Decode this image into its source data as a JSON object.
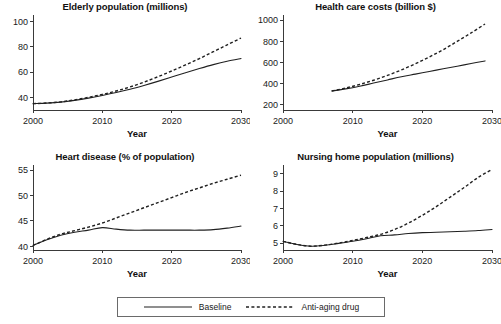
{
  "legend": {
    "name": "chart-legend",
    "entries": [
      {
        "label": "Baseline",
        "style": "solid"
      },
      {
        "label": "Anti-aging drug",
        "style": "dashed"
      }
    ]
  },
  "chart_data": [
    {
      "type": "line",
      "panel": "elderly-population",
      "title": "Elderly population (millions)",
      "xlabel": "Year",
      "ylabel": "",
      "xlim": [
        2000,
        2030
      ],
      "ylim": [
        30,
        105
      ],
      "xticks": [
        2000,
        2010,
        2020,
        2030
      ],
      "yticks": [
        40,
        60,
        80,
        100
      ],
      "grid": false,
      "legend_position": "bottom-outside",
      "x": [
        2000,
        2002,
        2004,
        2006,
        2008,
        2010,
        2012,
        2014,
        2016,
        2018,
        2020,
        2022,
        2024,
        2026,
        2028,
        2030
      ],
      "series": [
        {
          "name": "Baseline",
          "style": "solid",
          "values": [
            35,
            35.4,
            36.2,
            37.6,
            39.4,
            41.5,
            43.8,
            46.4,
            49.4,
            52.6,
            56.0,
            59.4,
            62.7,
            65.8,
            68.5,
            70.7
          ]
        },
        {
          "name": "Anti-aging drug",
          "style": "dashed",
          "values": [
            35,
            35.5,
            36.4,
            38.0,
            40.0,
            42.3,
            45.0,
            48.2,
            52.0,
            56.2,
            60.8,
            65.6,
            70.6,
            76.0,
            81.4,
            86.8
          ]
        }
      ]
    },
    {
      "type": "line",
      "panel": "health-care-costs",
      "title": "Health care costs (billion $)",
      "xlabel": "Year",
      "ylabel": "",
      "xlim": [
        2000,
        2030
      ],
      "ylim": [
        150,
        1050
      ],
      "xticks": [
        2000,
        2010,
        2020,
        2030
      ],
      "yticks": [
        200,
        400,
        600,
        800,
        1000
      ],
      "grid": false,
      "legend_position": "bottom-outside",
      "x": [
        2007,
        2009,
        2011,
        2013,
        2015,
        2017,
        2019,
        2021,
        2023,
        2025,
        2027,
        2029
      ],
      "series": [
        {
          "name": "Baseline",
          "style": "solid",
          "values": [
            330,
            350,
            375,
            405,
            435,
            465,
            490,
            515,
            540,
            565,
            590,
            615
          ]
        },
        {
          "name": "Anti-aging drug",
          "style": "dashed",
          "values": [
            330,
            358,
            392,
            432,
            478,
            530,
            588,
            652,
            722,
            800,
            880,
            965
          ]
        }
      ]
    },
    {
      "type": "line",
      "panel": "heart-disease",
      "title": "Heart disease (% of population)",
      "xlabel": "Year",
      "ylabel": "",
      "xlim": [
        2000,
        2030
      ],
      "ylim": [
        39.3,
        56
      ],
      "xticks": [
        2000,
        2010,
        2020,
        2030
      ],
      "yticks": [
        40,
        45,
        50,
        55
      ],
      "grid": false,
      "legend_position": "bottom-outside",
      "x": [
        2000,
        2002,
        2004,
        2006,
        2008,
        2010,
        2012,
        2014,
        2016,
        2018,
        2020,
        2022,
        2024,
        2026,
        2028,
        2030
      ],
      "series": [
        {
          "name": "Baseline",
          "style": "solid",
          "values": [
            40.2,
            41.3,
            42.2,
            42.8,
            43.2,
            43.7,
            43.4,
            43.2,
            43.2,
            43.2,
            43.2,
            43.2,
            43.2,
            43.3,
            43.6,
            44.0
          ]
        },
        {
          "name": "Anti-aging drug",
          "style": "dashed",
          "values": [
            40.2,
            41.4,
            42.4,
            43.1,
            43.8,
            44.6,
            45.6,
            46.6,
            47.6,
            48.6,
            49.6,
            50.6,
            51.5,
            52.4,
            53.2,
            54.0
          ]
        }
      ]
    },
    {
      "type": "line",
      "panel": "nursing-home-population",
      "title": "Nursing home population (millions)",
      "xlabel": "Year",
      "ylabel": "",
      "xlim": [
        2000,
        2030
      ],
      "ylim": [
        4.6,
        9.5
      ],
      "xticks": [
        2000,
        2010,
        2020,
        2030
      ],
      "yticks": [
        5,
        6,
        7,
        8,
        9
      ],
      "grid": false,
      "legend_position": "bottom-outside",
      "x": [
        2000,
        2002,
        2004,
        2006,
        2008,
        2010,
        2012,
        2014,
        2016,
        2018,
        2020,
        2022,
        2024,
        2026,
        2028,
        2030
      ],
      "series": [
        {
          "name": "Baseline",
          "style": "solid",
          "values": [
            5.1,
            4.92,
            4.82,
            4.87,
            4.98,
            5.1,
            5.25,
            5.42,
            5.47,
            5.55,
            5.6,
            5.62,
            5.65,
            5.68,
            5.72,
            5.78
          ]
        },
        {
          "name": "Anti-aging drug",
          "style": "dashed",
          "values": [
            5.1,
            4.92,
            4.82,
            4.88,
            5.0,
            5.15,
            5.32,
            5.5,
            5.78,
            6.15,
            6.6,
            7.1,
            7.65,
            8.2,
            8.78,
            9.25
          ]
        }
      ]
    }
  ]
}
